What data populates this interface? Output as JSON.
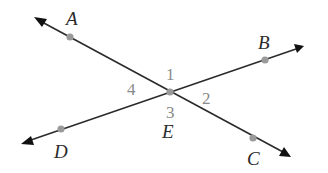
{
  "diagram": {
    "colors": {
      "line": "#2b2b2b",
      "point": "#9a9a9a",
      "point_label": "#2b2b2b",
      "angle_label": "#8a8a8a",
      "background": "#ffffff"
    },
    "lines": [
      {
        "name": "line-AC",
        "from": "A",
        "to": "C",
        "arrows": "both"
      },
      {
        "name": "line-DB",
        "from": "D",
        "to": "B",
        "arrows": "both"
      }
    ],
    "points": [
      {
        "id": "A",
        "label": "A"
      },
      {
        "id": "B",
        "label": "B"
      },
      {
        "id": "C",
        "label": "C"
      },
      {
        "id": "D",
        "label": "D"
      },
      {
        "id": "E",
        "label": "E"
      }
    ],
    "angles": [
      {
        "id": "1",
        "label": "1",
        "position": "top"
      },
      {
        "id": "2",
        "label": "2",
        "position": "right"
      },
      {
        "id": "3",
        "label": "3",
        "position": "bottom"
      },
      {
        "id": "4",
        "label": "4",
        "position": "left"
      }
    ]
  }
}
